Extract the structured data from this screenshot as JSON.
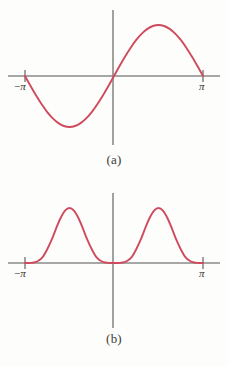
{
  "figure": {
    "background_color": "#fdfdfb",
    "curve_color": "#d04a5e",
    "axis_color": "#8a8a8a",
    "text_color": "#333333"
  },
  "panels": [
    {
      "id": "a",
      "caption": "(a)",
      "x_min_label": "−π",
      "x_max_label": "π",
      "axis_y_px": 76,
      "axis_x_px": 113
    },
    {
      "id": "b",
      "caption": "(b)",
      "x_min_label": "−π",
      "x_max_label": "π",
      "axis_y_px": 80,
      "axis_x_px": 113
    }
  ],
  "chart_data": [
    {
      "type": "line",
      "title": "(a)",
      "xlabel": "",
      "ylabel": "",
      "xlim": [
        -3.14159,
        3.14159
      ],
      "ylim": [
        -1.15,
        1.15
      ],
      "xticks": [
        -3.14159,
        3.14159
      ],
      "xticklabels": [
        "−π",
        "π"
      ],
      "yticks": [],
      "yticklabels": [],
      "grid": false,
      "legend": false,
      "series": [
        {
          "name": "sin(x)",
          "color": "#d04a5e",
          "x": [
            -3.14159,
            -2.94524,
            -2.74889,
            -2.55254,
            -2.35619,
            -2.15984,
            -1.9635,
            -1.76715,
            -1.5708,
            -1.37445,
            -1.1781,
            -0.98175,
            -0.7854,
            -0.58905,
            -0.3927,
            -0.19635,
            0.0,
            0.19635,
            0.3927,
            0.58905,
            0.7854,
            0.98175,
            1.1781,
            1.37445,
            1.5708,
            1.76715,
            1.9635,
            2.15984,
            2.35619,
            2.55254,
            2.74889,
            2.94524,
            3.14159
          ],
          "y": [
            0.0,
            -0.19509,
            -0.38268,
            -0.55557,
            -0.70711,
            -0.83147,
            -0.92388,
            -0.98079,
            -1.0,
            -0.98079,
            -0.92388,
            -0.83147,
            -0.70711,
            -0.55557,
            -0.38268,
            -0.19509,
            0.0,
            0.19509,
            0.38268,
            0.55557,
            0.70711,
            0.83147,
            0.92388,
            0.98079,
            1.0,
            0.98079,
            0.92388,
            0.83147,
            0.70711,
            0.55557,
            0.38268,
            0.19509,
            0.0
          ]
        }
      ]
    },
    {
      "type": "line",
      "title": "(b)",
      "xlabel": "",
      "ylabel": "",
      "xlim": [
        -3.14159,
        3.14159
      ],
      "ylim": [
        -0.35,
        1.25
      ],
      "xticks": [
        -3.14159,
        3.14159
      ],
      "xticklabels": [
        "−π",
        "π"
      ],
      "yticks": [],
      "yticklabels": [],
      "grid": false,
      "legend": false,
      "series": [
        {
          "name": "sin^4(x)",
          "color": "#d04a5e",
          "x": [
            -3.14159,
            -2.98451,
            -2.82743,
            -2.67035,
            -2.51327,
            -2.35619,
            -2.19911,
            -2.04204,
            -1.88496,
            -1.72788,
            -1.5708,
            -1.41372,
            -1.25664,
            -1.09956,
            -0.94248,
            -0.7854,
            -0.62832,
            -0.47124,
            -0.31416,
            -0.15708,
            0.0,
            0.15708,
            0.31416,
            0.47124,
            0.62832,
            0.7854,
            0.94248,
            1.09956,
            1.25664,
            1.41372,
            1.5708,
            1.72788,
            1.88496,
            2.04204,
            2.19911,
            2.35619,
            2.51327,
            2.67035,
            2.82743,
            2.98451,
            3.14159
          ],
          "y": [
            0.0,
            0.00059,
            0.00905,
            0.04113,
            0.1126,
            0.25,
            0.42298,
            0.63041,
            0.81804,
            0.95133,
            1.0,
            0.95133,
            0.81804,
            0.63041,
            0.42298,
            0.25,
            0.1126,
            0.04113,
            0.00905,
            0.00059,
            0.0,
            0.00059,
            0.00905,
            0.04113,
            0.1126,
            0.25,
            0.42298,
            0.63041,
            0.81804,
            0.95133,
            1.0,
            0.95133,
            0.81804,
            0.63041,
            0.42298,
            0.25,
            0.1126,
            0.04113,
            0.00905,
            0.00059,
            0.0
          ]
        }
      ]
    }
  ]
}
